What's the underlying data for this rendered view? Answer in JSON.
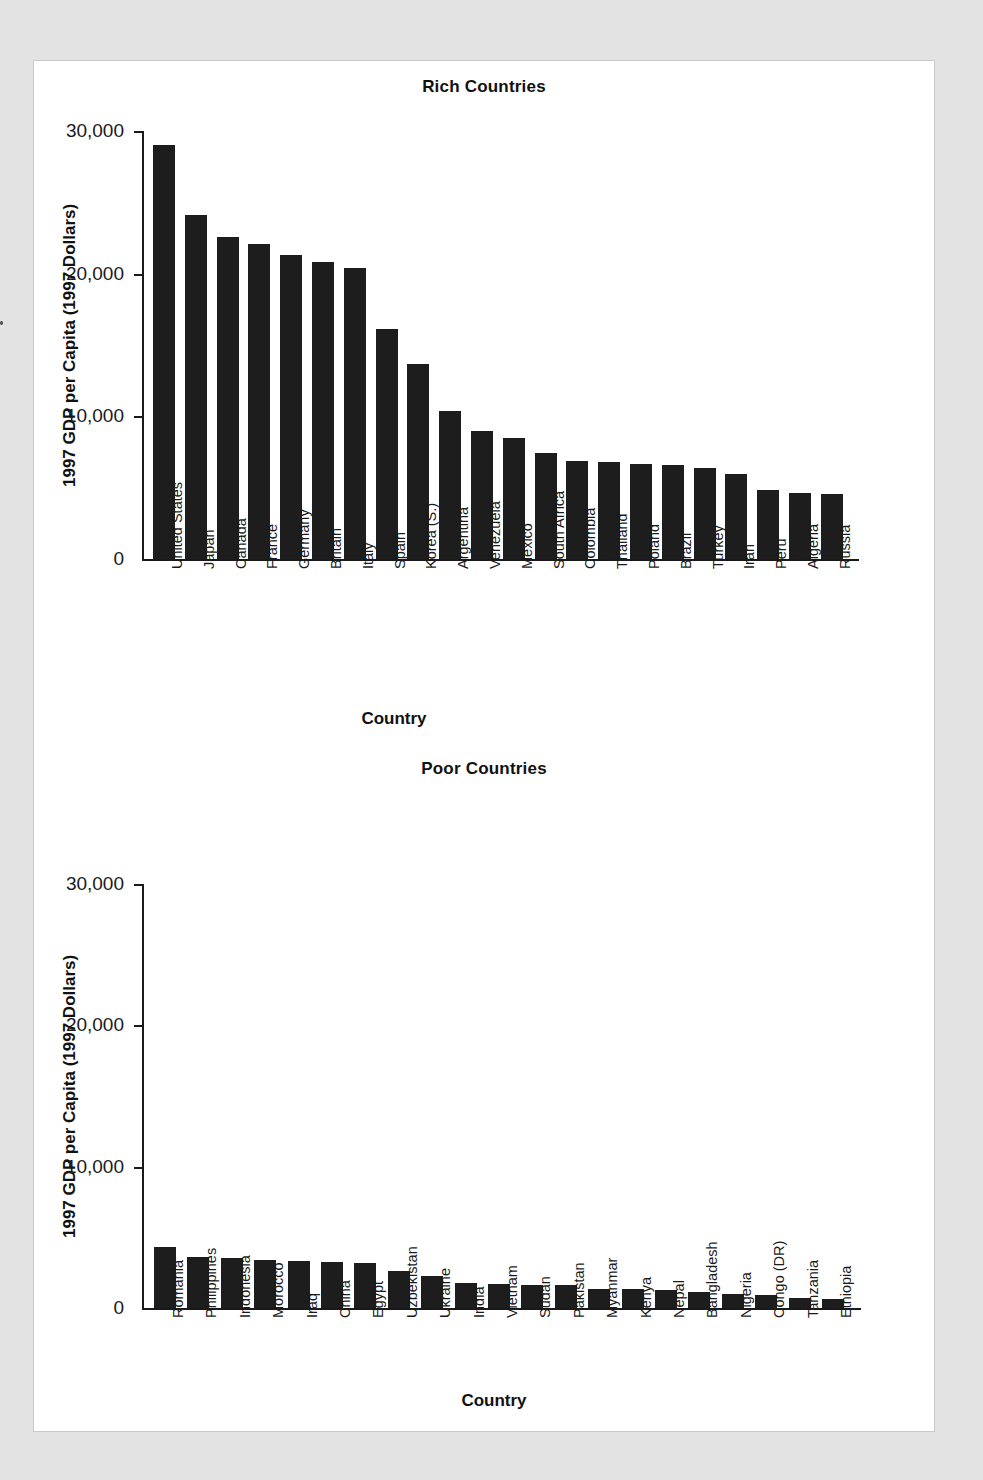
{
  "page": {
    "background_color": "#e3e3e3",
    "panel_color": "#ffffff",
    "bar_color": "#1d1d1d",
    "axis_color": "#1a1a1a"
  },
  "charts": [
    {
      "id": "rich-countries",
      "title": "Rich Countries",
      "ylabel": "1997 GDP per Capita (1997 Dollars)",
      "xlabel": "Country"
    },
    {
      "id": "poor-countries",
      "title": "Poor Countries",
      "ylabel": "1997 GDP per Capita (1997 Dollars)",
      "xlabel": "Country"
    }
  ],
  "chart_data": [
    {
      "type": "bar",
      "title": "Rich Countries",
      "xlabel": "Country",
      "ylabel": "1997 GDP per Capita (1997 Dollars)",
      "ylim": [
        0,
        30000
      ],
      "yticks": [
        0,
        10000,
        20000,
        30000
      ],
      "ytick_labels": [
        "0",
        "10,000",
        "20,000",
        "30,000"
      ],
      "grid": false,
      "legend": "none",
      "categories": [
        "United States",
        "Japan",
        "Canada",
        "France",
        "Germany",
        "Britain",
        "Italy",
        "Spain",
        "Korea (S.)",
        "Argentina",
        "Venezuela",
        "Mexico",
        "South Africa",
        "Colombia",
        "Thailand",
        "Poland",
        "Brazil",
        "Turkey",
        "Iran",
        "Peru",
        "Algeria",
        "Russia"
      ],
      "values": [
        29000,
        24100,
        22600,
        22100,
        21300,
        20800,
        20400,
        16100,
        13700,
        10400,
        9000,
        8500,
        7400,
        6900,
        6800,
        6650,
        6600,
        6400,
        5950,
        4850,
        4650,
        4550
      ]
    },
    {
      "type": "bar",
      "title": "Poor Countries",
      "xlabel": "Country",
      "ylabel": "1997 GDP per Capita (1997 Dollars)",
      "ylim": [
        0,
        30000
      ],
      "yticks": [
        0,
        10000,
        20000,
        30000
      ],
      "ytick_labels": [
        "0",
        "10,000",
        "20,000",
        "30,000"
      ],
      "grid": false,
      "legend": "none",
      "categories": [
        "Romania",
        "Philippines",
        "Indonesia",
        "Morocco",
        "Iraq",
        "China",
        "Egypt",
        "Uzbekistan",
        "Ukraine",
        "India",
        "Vietnam",
        "Sudan",
        "Pakistan",
        "Myanmar",
        "Kenya",
        "Nepal",
        "Bangladesh",
        "Nigeria",
        "Congo (DR)",
        "Tanzania",
        "Ethiopia"
      ],
      "values": [
        4300,
        3600,
        3550,
        3400,
        3350,
        3250,
        3150,
        2600,
        2250,
        1750,
        1720,
        1650,
        1600,
        1350,
        1330,
        1250,
        1150,
        1020,
        950,
        700,
        620
      ]
    }
  ]
}
